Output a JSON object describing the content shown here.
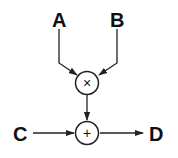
{
  "diagram": {
    "inputs": [
      {
        "id": "A",
        "label": "A"
      },
      {
        "id": "B",
        "label": "B"
      },
      {
        "id": "C",
        "label": "C"
      }
    ],
    "output": {
      "id": "D",
      "label": "D"
    },
    "operators": [
      {
        "id": "mul",
        "symbol": "×",
        "inputs": [
          "A",
          "B"
        ]
      },
      {
        "id": "add",
        "symbol": "+",
        "inputs": [
          "mul",
          "C"
        ],
        "output": "D"
      }
    ],
    "edges": [
      {
        "from": "A",
        "to": "mul"
      },
      {
        "from": "B",
        "to": "mul"
      },
      {
        "from": "mul",
        "to": "add"
      },
      {
        "from": "C",
        "to": "add"
      },
      {
        "from": "add",
        "to": "D"
      }
    ]
  }
}
